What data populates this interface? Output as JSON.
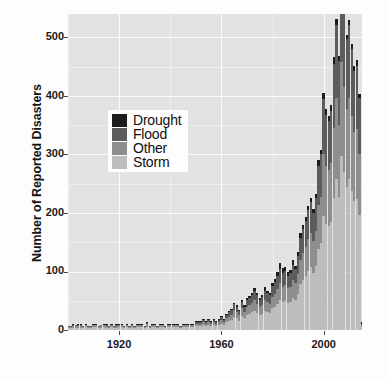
{
  "chart_data": {
    "type": "bar",
    "stacked": true,
    "title": "",
    "subtitle": "",
    "xlabel": "",
    "ylabel": "Number of Reported Disasters",
    "xlim": [
      1900,
      2015
    ],
    "ylim": [
      0,
      540
    ],
    "xticks": [
      1920,
      1960,
      2000
    ],
    "xtick_labels": [
      "1920",
      "1960",
      "2000"
    ],
    "yticks": [
      0,
      100,
      200,
      300,
      400,
      500
    ],
    "ytick_labels": [
      "0",
      "100",
      "200",
      "300",
      "400",
      "500"
    ],
    "grid": true,
    "grid_color": "#fbfbfb",
    "panel_background": "#e2e2e2",
    "legend_position": "inside-upper-left",
    "series": [
      {
        "name": "Drought",
        "color": "#1c1c1c"
      },
      {
        "name": "Flood",
        "color": "#5c5c5c"
      },
      {
        "name": "Other",
        "color": "#8e8e8e"
      },
      {
        "name": "Storm",
        "color": "#bdbdbd"
      }
    ],
    "x": [
      1900,
      1901,
      1902,
      1903,
      1904,
      1905,
      1906,
      1907,
      1908,
      1909,
      1910,
      1911,
      1912,
      1913,
      1914,
      1915,
      1916,
      1917,
      1918,
      1919,
      1920,
      1921,
      1922,
      1923,
      1924,
      1925,
      1926,
      1927,
      1928,
      1929,
      1930,
      1931,
      1932,
      1933,
      1934,
      1935,
      1936,
      1937,
      1938,
      1939,
      1940,
      1941,
      1942,
      1943,
      1944,
      1945,
      1946,
      1947,
      1948,
      1949,
      1950,
      1951,
      1952,
      1953,
      1954,
      1955,
      1956,
      1957,
      1958,
      1959,
      1960,
      1961,
      1962,
      1963,
      1964,
      1965,
      1966,
      1967,
      1968,
      1969,
      1970,
      1971,
      1972,
      1973,
      1974,
      1975,
      1976,
      1977,
      1978,
      1979,
      1980,
      1981,
      1982,
      1983,
      1984,
      1985,
      1986,
      1987,
      1988,
      1989,
      1990,
      1991,
      1992,
      1993,
      1994,
      1995,
      1996,
      1997,
      1998,
      1999,
      2000,
      2001,
      2002,
      2003,
      2004,
      2005,
      2006,
      2007,
      2008,
      2009,
      2010,
      2011,
      2012,
      2013,
      2014,
      2015
    ],
    "values": {
      "Drought": [
        0,
        0,
        1,
        0,
        1,
        1,
        0,
        1,
        0,
        0,
        1,
        1,
        0,
        0,
        1,
        1,
        0,
        1,
        0,
        1,
        1,
        1,
        0,
        1,
        0,
        1,
        0,
        1,
        1,
        1,
        0,
        1,
        0,
        1,
        1,
        0,
        1,
        1,
        0,
        1,
        1,
        1,
        1,
        1,
        0,
        1,
        1,
        1,
        1,
        1,
        1,
        1,
        1,
        1,
        1,
        1,
        1,
        1,
        1,
        1,
        2,
        1,
        2,
        2,
        2,
        3,
        3,
        2,
        3,
        2,
        3,
        3,
        4,
        5,
        4,
        3,
        4,
        6,
        3,
        4,
        5,
        6,
        8,
        10,
        9,
        7,
        6,
        6,
        8,
        6,
        7,
        8,
        7,
        6,
        7,
        8,
        6,
        7,
        9,
        8,
        10,
        9,
        8,
        9,
        11,
        10,
        9,
        8,
        9,
        8,
        9,
        8,
        9,
        10,
        8,
        2
      ],
      "Flood": [
        1,
        1,
        2,
        2,
        2,
        2,
        1,
        2,
        1,
        1,
        2,
        2,
        1,
        2,
        2,
        2,
        1,
        2,
        1,
        2,
        2,
        2,
        1,
        2,
        1,
        2,
        1,
        2,
        2,
        2,
        1,
        3,
        1,
        2,
        2,
        1,
        2,
        2,
        1,
        2,
        2,
        2,
        2,
        2,
        1,
        2,
        2,
        2,
        2,
        2,
        3,
        3,
        3,
        4,
        3,
        4,
        3,
        4,
        3,
        4,
        5,
        4,
        6,
        7,
        8,
        10,
        9,
        8,
        11,
        9,
        12,
        13,
        14,
        15,
        14,
        12,
        13,
        16,
        15,
        14,
        18,
        20,
        22,
        25,
        23,
        24,
        22,
        23,
        26,
        24,
        30,
        38,
        42,
        45,
        50,
        52,
        48,
        55,
        68,
        72,
        95,
        88,
        85,
        90,
        110,
        125,
        110,
        145,
        130,
        120,
        125,
        115,
        105,
        108,
        95,
        3
      ],
      "Other": [
        2,
        2,
        3,
        3,
        3,
        3,
        2,
        3,
        2,
        2,
        3,
        3,
        2,
        3,
        3,
        3,
        2,
        3,
        2,
        3,
        3,
        3,
        2,
        3,
        2,
        3,
        2,
        3,
        3,
        3,
        2,
        4,
        2,
        3,
        3,
        2,
        3,
        3,
        2,
        3,
        3,
        3,
        3,
        3,
        2,
        3,
        3,
        3,
        3,
        3,
        4,
        4,
        4,
        5,
        4,
        5,
        4,
        5,
        4,
        5,
        6,
        5,
        7,
        8,
        9,
        12,
        11,
        9,
        13,
        11,
        14,
        15,
        16,
        18,
        16,
        14,
        15,
        18,
        17,
        16,
        20,
        22,
        25,
        28,
        26,
        27,
        25,
        26,
        30,
        28,
        34,
        42,
        46,
        50,
        55,
        58,
        54,
        60,
        75,
        80,
        105,
        98,
        95,
        100,
        120,
        138,
        122,
        160,
        145,
        132,
        138,
        128,
        118,
        120,
        105,
        3
      ],
      "Storm": [
        3,
        3,
        4,
        4,
        4,
        4,
        3,
        5,
        3,
        3,
        5,
        5,
        3,
        4,
        5,
        4,
        3,
        5,
        3,
        4,
        5,
        5,
        3,
        5,
        3,
        5,
        3,
        5,
        5,
        5,
        3,
        6,
        3,
        5,
        5,
        3,
        5,
        5,
        3,
        5,
        5,
        5,
        5,
        5,
        3,
        5,
        5,
        5,
        5,
        5,
        7,
        7,
        7,
        9,
        7,
        9,
        7,
        9,
        7,
        9,
        11,
        9,
        13,
        15,
        17,
        22,
        20,
        16,
        24,
        20,
        26,
        27,
        30,
        33,
        29,
        26,
        28,
        33,
        31,
        29,
        37,
        40,
        45,
        52,
        48,
        50,
        46,
        48,
        55,
        52,
        62,
        78,
        85,
        92,
        100,
        108,
        98,
        110,
        138,
        148,
        195,
        182,
        178,
        185,
        225,
        258,
        228,
        298,
        270,
        245,
        258,
        238,
        220,
        224,
        196,
        5
      ]
    },
    "peak": {
      "year": 2007,
      "value": 521
    }
  },
  "legend": {
    "items": [
      {
        "label": "Drought",
        "color": "#1c1c1c"
      },
      {
        "label": "Flood",
        "color": "#5c5c5c"
      },
      {
        "label": "Other",
        "color": "#8e8e8e"
      },
      {
        "label": "Storm",
        "color": "#bdbdbd"
      }
    ]
  },
  "axes": {
    "y_title": "Number of Reported Disasters",
    "y_labels": [
      "500",
      "400",
      "300",
      "200",
      "100",
      "0"
    ],
    "x_labels": [
      "1920",
      "1960",
      "2000"
    ]
  }
}
